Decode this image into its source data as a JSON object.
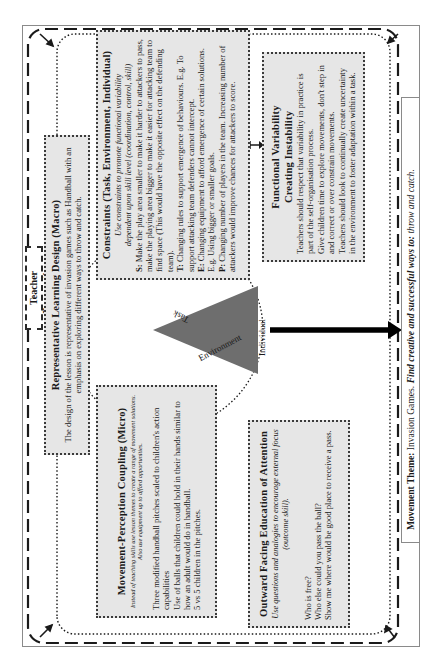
{
  "teacher_preparation": {
    "label": "Teacher Preparation"
  },
  "representative_learning_design": {
    "title": "Representative Learning Design (Macro)",
    "body": "The design of the lesson is representative of invasion games such as Handball with an emphasis on exploring different ways to throw and catch."
  },
  "constraints": {
    "title": "Constraints (Task, Environment, Individual)",
    "subtitle_prefix": "Use constraints to promote ",
    "subtitle_emph": "functional variability",
    "subtitle_line2": "dependent upon skill level (coordination, control, skill)",
    "items": [
      {
        "key": "S:",
        "text": " Make the play area smaller to make it harder to attackers to pass, make the playing area bigger to make it easier for attacking team to find space (This would have the opposite effect on the defending team)."
      },
      {
        "key": "T:",
        "text": " Changing rules to support emergence of behaviours. E.g. To support attacking team defenders cannot intercept."
      },
      {
        "key": "E:",
        "text": " Changing equipment to afford emergence of certain solutions. E.g. Using bigger or smaller goals."
      },
      {
        "key": "P:",
        "text": " Changing number of players in the team. Increasing number of attackers would improve chances for attackers to score."
      }
    ]
  },
  "functional_variability": {
    "title_line1": "Functional Variability",
    "title_line2": "Creating Instability",
    "lines": [
      "Teachers should respect that variability in practice is part of the self-organisation process.",
      "Give children time to explore movements, don't step in and correct or over constrain movements.",
      "Teachers should look to continually create uncertainty in the environment to foster adaptation within a task."
    ]
  },
  "movement_perception_coupling": {
    "title": "Movement-Perception Coupling (Micro)",
    "subtitle": "Instead of teaching skills use lesson themes to create a range of movement solutions. Also use equipment up to afford opportunities.",
    "lines": [
      "Three modified handball pitches scaled to children's action capabilities",
      "Use of balls that children could hold in their hands similar to how an adult would do in handball.",
      "5 vs 5 children in the pitches."
    ]
  },
  "outward_facing": {
    "title": "Outward Facing Education of Attention",
    "subtitle": "Use questions and analogies to encourage external focus (outcome skill).",
    "lines": [
      "Who is free?",
      "Who else could you pass the ball?",
      "Show me where would be good place to receive a pass."
    ]
  },
  "constraint_triangle": {
    "labels": {
      "top": "Task",
      "bottom": "Environment",
      "right": "Individual"
    },
    "fill_color": "#6e6e6e"
  },
  "movement_theme": {
    "label": "Movement Theme:",
    "value": " Invasion Games. ",
    "goal_emph": "Find creative and successful ways to:",
    "goal_rest": " throw and catch."
  }
}
